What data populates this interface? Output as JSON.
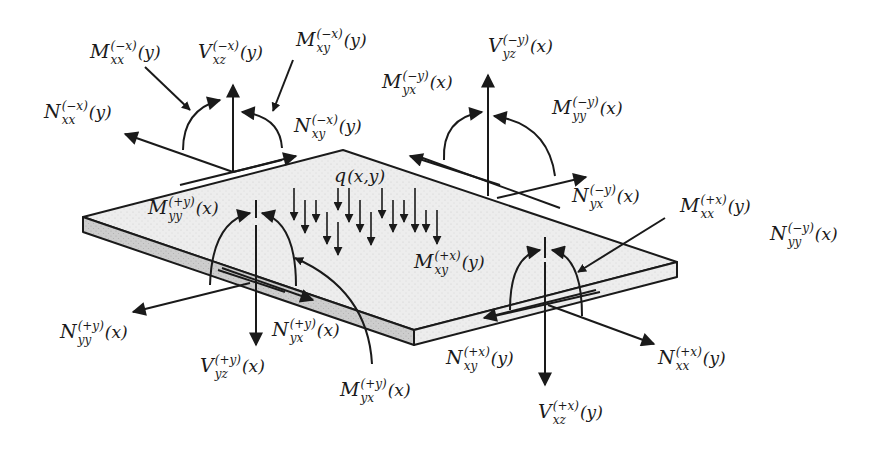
{
  "diagram": {
    "type": "plate-stress-resultants",
    "colors": {
      "ink": "#1a1a1a",
      "plate_top": "#eeeeee",
      "plate_edge": "#cfcfcf"
    },
    "load": {
      "sym": "q",
      "args": "(x,y)"
    },
    "labels": {
      "Mxx_mx": {
        "sym": "M",
        "sup": "(−x)",
        "sub": "xx",
        "arg": "(y)"
      },
      "Vxz_mx": {
        "sym": "V",
        "sup": "(−x)",
        "sub": "xz",
        "arg": "(y)"
      },
      "Mxy_mx": {
        "sym": "M",
        "sup": "(−x)",
        "sub": "xy",
        "arg": "(y)"
      },
      "Nxx_mx": {
        "sym": "N",
        "sup": "(−x)",
        "sub": "xx",
        "arg": "(y)"
      },
      "Nxy_mx": {
        "sym": "N",
        "sup": "(−x)",
        "sub": "xy",
        "arg": "(y)"
      },
      "Vyz_my": {
        "sym": "V",
        "sup": "(−y)",
        "sub": "yz",
        "arg": "(x)"
      },
      "Myx_my": {
        "sym": "M",
        "sup": "(−y)",
        "sub": "yx",
        "arg": "(x)"
      },
      "Myy_my": {
        "sym": "M",
        "sup": "(−y)",
        "sub": "yy",
        "arg": "(x)"
      },
      "Nyx_my": {
        "sym": "N",
        "sup": "(−y)",
        "sub": "yx",
        "arg": "(x)"
      },
      "Nyy_my": {
        "sym": "N",
        "sup": "(−y)",
        "sub": "yy",
        "arg": "(x)"
      },
      "Mxx_px": {
        "sym": "M",
        "sup": "(+x)",
        "sub": "xx",
        "arg": "(y)"
      },
      "Mxy_px": {
        "sym": "M",
        "sup": "(+x)",
        "sub": "xy",
        "arg": "(y)"
      },
      "Nxy_px": {
        "sym": "N",
        "sup": "(+x)",
        "sub": "xy",
        "arg": "(y)"
      },
      "Nxx_px": {
        "sym": "N",
        "sup": "(+x)",
        "sub": "xx",
        "arg": "(y)"
      },
      "Vxz_px": {
        "sym": "V",
        "sup": "(+x)",
        "sub": "xz",
        "arg": "(y)"
      },
      "Myy_py": {
        "sym": "M",
        "sup": "(+y)",
        "sub": "yy",
        "arg": "(x)"
      },
      "Nyy_py": {
        "sym": "N",
        "sup": "(+y)",
        "sub": "yy",
        "arg": "(x)"
      },
      "Nyx_py": {
        "sym": "N",
        "sup": "(+y)",
        "sub": "yx",
        "arg": "(x)"
      },
      "Vyz_py": {
        "sym": "V",
        "sup": "(+y)",
        "sub": "yz",
        "arg": "(x)"
      },
      "Myx_py": {
        "sym": "M",
        "sup": "(+y)",
        "sub": "yx",
        "arg": "(x)"
      }
    }
  }
}
